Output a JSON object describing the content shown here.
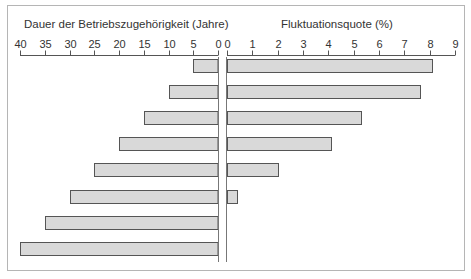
{
  "chart_data": {
    "type": "bar",
    "orientation": "horizontal",
    "layout": "back-to-back",
    "left_panel": {
      "title": "Dauer der Betriebszugehörigkeit (Jahre)",
      "axis_ticks": [
        40,
        35,
        30,
        25,
        20,
        15,
        10,
        5,
        0
      ],
      "xlim": [
        40,
        0
      ],
      "values": [
        5,
        10,
        15,
        20,
        25,
        30,
        35,
        40
      ]
    },
    "right_panel": {
      "title": "Fluktuationsquote (%)",
      "axis_ticks": [
        0,
        1,
        2,
        3,
        4,
        5,
        6,
        7,
        8,
        9
      ],
      "xlim": [
        0,
        9
      ],
      "values": [
        8.1,
        7.6,
        5.3,
        4.1,
        2.0,
        0.4,
        0,
        0
      ]
    },
    "bar_fill": "#d9d9d9",
    "bar_stroke": "#555555",
    "grid": false,
    "legend": null
  }
}
